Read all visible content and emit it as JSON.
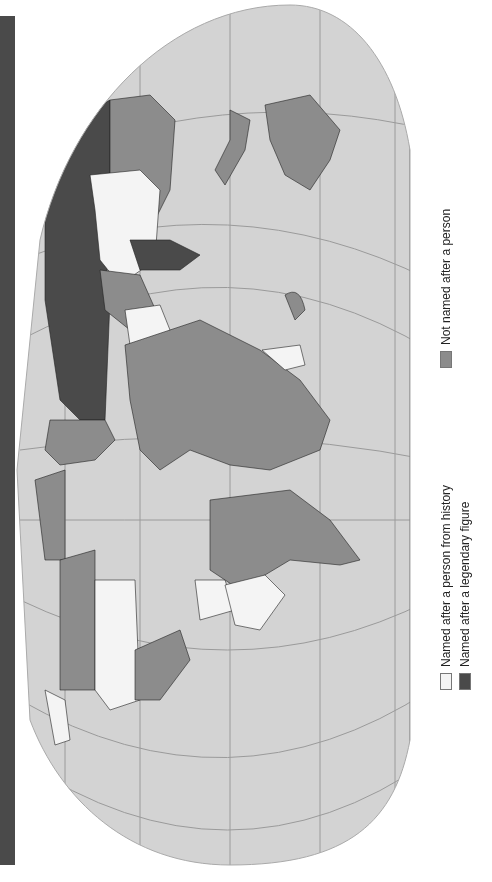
{
  "map": {
    "projection": "world map (rotated 90° counter-clockwise)",
    "colors": {
      "ocean": "#d3d3d3",
      "not_named_after_person": "#8c8c8c",
      "named_after_historical_person": "#f4f4f4",
      "named_after_legendary_figure": "#4a4a4a",
      "graticule": "#9a9a9a",
      "side_band": "#4a4a4a"
    }
  },
  "legend": {
    "items": [
      {
        "label": "Named after a person from history",
        "color": "#f4f4f4"
      },
      {
        "label": "Named after a legendary figure",
        "color": "#4a4a4a"
      },
      {
        "label": "Not named after a person",
        "color": "#8c8c8c"
      }
    ]
  }
}
